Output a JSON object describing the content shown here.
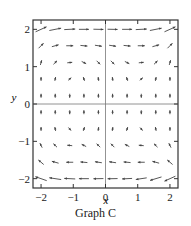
{
  "chart_data": {
    "type": "vector_field",
    "title": "Graph C",
    "xlabel": "x",
    "ylabel": "y",
    "xlim": [
      -2.25,
      2.25
    ],
    "ylim": [
      -2.25,
      2.25
    ],
    "xticks": [
      -2,
      -1,
      0,
      1,
      2
    ],
    "yticks": [
      -2,
      -1,
      0,
      1,
      2
    ],
    "xtick_labels": [
      "−2",
      "−1",
      "0",
      "1",
      "2"
    ],
    "ytick_labels": [
      "−2",
      "−1",
      "0",
      "1",
      "2"
    ],
    "grid": false,
    "axes_lines": {
      "x0": true,
      "y0": true
    },
    "grid_x": [
      -2.0,
      -1.56,
      -1.11,
      -0.67,
      -0.22,
      0.22,
      0.67,
      1.11,
      1.56,
      2.0
    ],
    "grid_y": [
      2.0,
      1.56,
      1.11,
      0.67,
      0.22,
      -0.22,
      -0.67,
      -1.11,
      -1.56,
      -2.0
    ],
    "vectors": [
      [
        [
          1,
          0.45
        ],
        [
          1,
          0.2
        ],
        [
          1,
          0.05
        ],
        [
          1,
          0
        ],
        [
          1,
          -0.02
        ],
        [
          1,
          -0.02
        ],
        [
          1,
          0
        ],
        [
          1,
          0.05
        ],
        [
          1,
          0.2
        ],
        [
          1,
          0.45
        ]
      ],
      [
        [
          0.6,
          0.6
        ],
        [
          0.9,
          0.25
        ],
        [
          1,
          0
        ],
        [
          1,
          -0.1
        ],
        [
          1,
          -0.15
        ],
        [
          1,
          -0.15
        ],
        [
          1,
          -0.1
        ],
        [
          1,
          0
        ],
        [
          0.9,
          0.25
        ],
        [
          0.6,
          0.6
        ]
      ],
      [
        [
          0.25,
          0.9
        ],
        [
          0.6,
          0.6
        ],
        [
          1,
          0.1
        ],
        [
          0.8,
          -0.4
        ],
        [
          0.6,
          -0.6
        ],
        [
          0.6,
          -0.6
        ],
        [
          0.8,
          -0.4
        ],
        [
          1,
          0.1
        ],
        [
          0.6,
          0.6
        ],
        [
          0.25,
          0.9
        ]
      ],
      [
        [
          0,
          1
        ],
        [
          0.2,
          1
        ],
        [
          0.7,
          0.6
        ],
        [
          -0.3,
          0.9
        ],
        [
          -0.15,
          1
        ],
        [
          -0.15,
          1
        ],
        [
          -0.3,
          0.9
        ],
        [
          0.7,
          0.6
        ],
        [
          0.2,
          1
        ],
        [
          0,
          1
        ]
      ],
      [
        [
          0,
          1
        ],
        [
          0,
          1
        ],
        [
          0,
          -1
        ],
        [
          0,
          1
        ],
        [
          0,
          1
        ],
        [
          0,
          1
        ],
        [
          0,
          1
        ],
        [
          0,
          -1
        ],
        [
          0,
          1
        ],
        [
          0,
          1
        ]
      ],
      [
        [
          0,
          1
        ],
        [
          0,
          1
        ],
        [
          0,
          -1
        ],
        [
          0,
          1
        ],
        [
          0,
          1
        ],
        [
          0,
          1
        ],
        [
          0,
          1
        ],
        [
          0,
          -1
        ],
        [
          0,
          1
        ],
        [
          0,
          1
        ]
      ],
      [
        [
          0,
          1
        ],
        [
          -0.2,
          1
        ],
        [
          0.6,
          -0.7
        ],
        [
          0.3,
          0.9
        ],
        [
          0.15,
          1
        ],
        [
          0.15,
          1
        ],
        [
          0.3,
          0.9
        ],
        [
          0.6,
          -0.7
        ],
        [
          -0.2,
          1
        ],
        [
          0,
          1
        ]
      ],
      [
        [
          -0.4,
          0.8
        ],
        [
          -0.6,
          0.6
        ],
        [
          -1,
          0.1
        ],
        [
          -0.8,
          0.4
        ],
        [
          -0.6,
          0.6
        ],
        [
          -0.6,
          0.6
        ],
        [
          -0.8,
          0.4
        ],
        [
          -1,
          0.1
        ],
        [
          -0.6,
          0.6
        ],
        [
          -0.4,
          0.8
        ]
      ],
      [
        [
          -0.7,
          0.6
        ],
        [
          -0.9,
          0.25
        ],
        [
          -1,
          0
        ],
        [
          -1,
          0.1
        ],
        [
          -1,
          0.15
        ],
        [
          -1,
          0.15
        ],
        [
          -1,
          0.1
        ],
        [
          -1,
          0
        ],
        [
          -0.9,
          0.25
        ],
        [
          -0.7,
          0.6
        ]
      ],
      [
        [
          -1,
          0.35
        ],
        [
          -1,
          0.15
        ],
        [
          -1,
          0.05
        ],
        [
          -1,
          0
        ],
        [
          -1,
          -0.02
        ],
        [
          -1,
          -0.02
        ],
        [
          -1,
          -0.05
        ],
        [
          -1,
          -0.15
        ],
        [
          -1,
          -0.3
        ],
        [
          -1,
          -0.45
        ]
      ]
    ],
    "magnitudes": [
      [
        12,
        12,
        11,
        10,
        10,
        10,
        10,
        11,
        12,
        12
      ],
      [
        7,
        7,
        7,
        7,
        7,
        7,
        7,
        7,
        7,
        7
      ],
      [
        5,
        5,
        5,
        5,
        5,
        5,
        5,
        5,
        5,
        5
      ],
      [
        4,
        4,
        4,
        4,
        4,
        4,
        4,
        4,
        4,
        4
      ],
      [
        4,
        4,
        4,
        4,
        4,
        4,
        4,
        4,
        4,
        4
      ],
      [
        4,
        4,
        4,
        4,
        4,
        4,
        4,
        4,
        4,
        4
      ],
      [
        4,
        4,
        4,
        4,
        4,
        4,
        4,
        4,
        4,
        4
      ],
      [
        5,
        5,
        5,
        5,
        5,
        5,
        5,
        5,
        5,
        5
      ],
      [
        7,
        7,
        7,
        7,
        7,
        7,
        7,
        7,
        7,
        7
      ],
      [
        12,
        12,
        11,
        10,
        10,
        10,
        10,
        11,
        12,
        12
      ]
    ]
  },
  "caption": "Graph C",
  "colors": {
    "axes": "#333333",
    "arrows": "#444444",
    "text": "#1a1a1a"
  }
}
